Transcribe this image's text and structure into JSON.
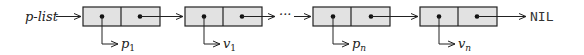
{
  "diagram": {
    "head_label": "p-list",
    "terminator": "NIL",
    "ellipsis": "···",
    "colors": {
      "cell_fill": "#e2e2e2",
      "stroke": "#222222",
      "text": "#222222"
    },
    "nodes": [
      {
        "id": "node-1",
        "car_label": "p",
        "car_sub": "1"
      },
      {
        "id": "node-2",
        "car_label": "v",
        "car_sub": "1"
      },
      {
        "id": "node-3",
        "car_label": "p",
        "car_sub": "n"
      },
      {
        "id": "node-4",
        "car_label": "v",
        "car_sub": "n"
      }
    ]
  }
}
